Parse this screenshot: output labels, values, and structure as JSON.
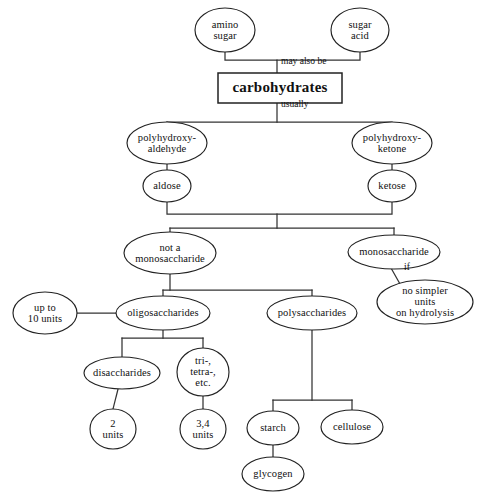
{
  "diagram": {
    "colors": {
      "background": "#ffffff",
      "stroke": "#222222",
      "edge": "#333333",
      "text": "#111111"
    },
    "nodes": [
      {
        "id": "amino_sugar",
        "label": "amino\nsugar",
        "shape": "ellipse",
        "cx": 225,
        "cy": 30,
        "rx": 30,
        "ry": 22
      },
      {
        "id": "sugar_acid",
        "label": "sugar\nacid",
        "shape": "ellipse",
        "cx": 360,
        "cy": 30,
        "rx": 29,
        "ry": 22
      },
      {
        "id": "carbohydrates",
        "label": "carbohydrates",
        "shape": "box",
        "cx": 280,
        "cy": 88,
        "rx": 62,
        "ry": 15
      },
      {
        "id": "polyhydroxy_ald",
        "label": "polyhydroxy-\naldehyde",
        "shape": "ellipse",
        "cx": 167,
        "cy": 143,
        "rx": 40,
        "ry": 21
      },
      {
        "id": "polyhydroxy_ket",
        "label": "polyhydroxy-\nketone",
        "shape": "ellipse",
        "cx": 392,
        "cy": 143,
        "rx": 40,
        "ry": 21
      },
      {
        "id": "aldose",
        "label": "aldose",
        "shape": "ellipse",
        "cx": 167,
        "cy": 186,
        "rx": 24,
        "ry": 16
      },
      {
        "id": "ketose",
        "label": "ketose",
        "shape": "ellipse",
        "cx": 392,
        "cy": 186,
        "rx": 24,
        "ry": 16
      },
      {
        "id": "not_a_mono",
        "label": "not a\nmonosaccharide",
        "shape": "ellipse",
        "cx": 170,
        "cy": 253,
        "rx": 46,
        "ry": 21
      },
      {
        "id": "monosaccharide",
        "label": "monosaccharide",
        "shape": "ellipse",
        "cx": 394,
        "cy": 252,
        "rx": 46,
        "ry": 17
      },
      {
        "id": "no_simpler_units",
        "label": "no simpler units\non hydrolysis",
        "shape": "ellipse",
        "cx": 425,
        "cy": 302,
        "rx": 48,
        "ry": 22
      },
      {
        "id": "up_to_10_units",
        "label": "up to\n10 units",
        "shape": "ellipse",
        "cx": 45,
        "cy": 313,
        "rx": 32,
        "ry": 21
      },
      {
        "id": "oligosaccharides",
        "label": "oligosaccharides",
        "shape": "ellipse",
        "cx": 163,
        "cy": 313,
        "rx": 47,
        "ry": 17
      },
      {
        "id": "polysaccharides",
        "label": "polysaccharides",
        "shape": "ellipse",
        "cx": 312,
        "cy": 313,
        "rx": 45,
        "ry": 17
      },
      {
        "id": "disaccharides",
        "label": "disaccharides",
        "shape": "ellipse",
        "cx": 122,
        "cy": 373,
        "rx": 38,
        "ry": 16
      },
      {
        "id": "tri_tetra_etc",
        "label": "tri-,\ntetra-,\netc.",
        "shape": "ellipse",
        "cx": 203,
        "cy": 372,
        "rx": 26,
        "ry": 24
      },
      {
        "id": "two_units",
        "label": "2\nunits",
        "shape": "ellipse",
        "cx": 113,
        "cy": 429,
        "rx": 23,
        "ry": 20
      },
      {
        "id": "three_four_units",
        "label": "3,4\nunits",
        "shape": "ellipse",
        "cx": 203,
        "cy": 429,
        "rx": 23,
        "ry": 20
      },
      {
        "id": "starch",
        "label": "starch",
        "shape": "ellipse",
        "cx": 273,
        "cy": 428,
        "rx": 26,
        "ry": 17
      },
      {
        "id": "cellulose",
        "label": "cellulose",
        "shape": "ellipse",
        "cx": 352,
        "cy": 427,
        "rx": 31,
        "ry": 17
      },
      {
        "id": "glycogen",
        "label": "glycogen",
        "shape": "ellipse",
        "cx": 273,
        "cy": 474,
        "rx": 31,
        "ry": 17
      }
    ],
    "edges": [
      {
        "id": "e-amino-bar",
        "from": "amino_sugar",
        "to": "carbohydrates",
        "points": "225,52 225,60 277,60 277,73"
      },
      {
        "id": "e-sugaracid-bar",
        "from": "sugar_acid",
        "to": "carbohydrates",
        "points": "360,52 360,60 277,60"
      },
      {
        "id": "e-carb-down",
        "from": "carbohydrates",
        "to": "branch_usually",
        "points": "277,103 277,122"
      },
      {
        "id": "e-split-ald",
        "from": "branch_usually",
        "to": "polyhydroxy_ald",
        "points": "167,122 392,122"
      },
      {
        "id": "e-ald-drop",
        "from": "branch_usually",
        "to": "polyhydroxy_ald",
        "points": "167,122 167,122"
      },
      {
        "id": "e-pha-aldose",
        "from": "polyhydroxy_ald",
        "to": "aldose",
        "points": "167,164 167,170"
      },
      {
        "id": "e-phk-ketose",
        "from": "polyhydroxy_ket",
        "to": "ketose",
        "points": "392,164 392,170"
      },
      {
        "id": "e-aldose-merge",
        "from": "aldose",
        "to": "merge_bar",
        "points": "167,202 167,214 392,214 392,202"
      },
      {
        "id": "e-merge-split",
        "from": "merge_bar",
        "to": "split_bar",
        "points": "277,214 277,228"
      },
      {
        "id": "e-split-notmono",
        "from": "split_bar",
        "to": "not_a_mono",
        "points": "170,228 394,228"
      },
      {
        "id": "e-notmono-drop",
        "from": "split_bar",
        "to": "not_a_mono",
        "points": "170,228 170,232"
      },
      {
        "id": "e-mono-drop",
        "from": "split_bar",
        "to": "monosaccharide",
        "points": "394,228 394,235"
      },
      {
        "id": "e-mono-if",
        "from": "monosaccharide",
        "to": "no_simpler_units",
        "points": "391,268 400,284"
      },
      {
        "id": "e-notmono-down",
        "from": "not_a_mono",
        "to": "oligo_bar",
        "points": "170,274 170,290"
      },
      {
        "id": "e-oligo-bar",
        "from": "oligo_bar",
        "to": "polysaccharides",
        "points": "163,290 312,290"
      },
      {
        "id": "e-oligo-drop",
        "from": "oligo_bar",
        "to": "oligosaccharides",
        "points": "163,290 163,296"
      },
      {
        "id": "e-poly-drop",
        "from": "oligo_bar",
        "to": "polysaccharides",
        "points": "312,290 312,296"
      },
      {
        "id": "e-upto-oligo",
        "from": "up_to_10_units",
        "to": "oligosaccharides",
        "points": "77,313 116,313"
      },
      {
        "id": "e-oligo-down",
        "from": "oligosaccharides",
        "to": "disacc_bar",
        "points": "163,330 163,338"
      },
      {
        "id": "e-disacc-bar",
        "from": "disacc_bar",
        "to": "tri_tetra_etc",
        "points": "122,338 203,338"
      },
      {
        "id": "e-disacc-drop",
        "from": "disacc_bar",
        "to": "disaccharides",
        "points": "122,338 122,357"
      },
      {
        "id": "e-tritetra-drop",
        "from": "disacc_bar",
        "to": "tri_tetra_etc",
        "points": "203,338 203,348"
      },
      {
        "id": "e-disacc-2units",
        "from": "disaccharides",
        "to": "two_units",
        "points": "118,389 113,409"
      },
      {
        "id": "e-tri-34units",
        "from": "tri_tetra_etc",
        "to": "three_four_units",
        "points": "203,396 203,409"
      },
      {
        "id": "e-poly-down",
        "from": "polysaccharides",
        "to": "starch_bar",
        "points": "312,330 312,400"
      },
      {
        "id": "e-starch-bar",
        "from": "starch_bar",
        "to": "cellulose",
        "points": "273,400 352,400"
      },
      {
        "id": "e-starch-drop",
        "from": "starch_bar",
        "to": "starch",
        "points": "273,400 273,411"
      },
      {
        "id": "e-cellulose-drop",
        "from": "starch_bar",
        "to": "cellulose",
        "points": "352,400 352,410"
      },
      {
        "id": "e-starch-glyc",
        "from": "starch",
        "to": "glycogen",
        "points": "273,445 273,457"
      }
    ],
    "edge_labels": [
      {
        "id": "lbl-may-also-be",
        "text": "may also be",
        "x": 281,
        "y": 62
      },
      {
        "id": "lbl-usually",
        "text": "usually",
        "x": 281,
        "y": 105
      },
      {
        "id": "lbl-if",
        "text": "if",
        "x": 404,
        "y": 268
      }
    ]
  }
}
